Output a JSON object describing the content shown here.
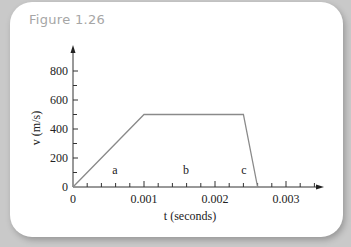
{
  "figure": {
    "title": "Figure 1.26",
    "background_color": "#c9c9c9",
    "card_color": "#ffffff",
    "title_color": "#a6a6a6",
    "line_color": "#8a8a8a"
  },
  "chart_data": {
    "type": "line",
    "title": "Figure 1.26",
    "xlabel": "t (seconds)",
    "ylabel": "v (m/s)",
    "x": [
      0,
      0.001,
      0.0024,
      0.0026
    ],
    "series": [
      {
        "name": "velocity",
        "values": [
          0,
          500,
          500,
          0
        ]
      }
    ],
    "xlim": [
      0,
      0.0036
    ],
    "ylim": [
      0,
      900
    ],
    "x_ticks": [
      "0",
      "0.001",
      "0.002",
      "0.003"
    ],
    "y_ticks": [
      "0",
      "200",
      "400",
      "600",
      "800"
    ],
    "x_minor_step": 0.0002,
    "y_minor_step": 100,
    "grid": false,
    "legend": null,
    "annotations": [
      {
        "text": "a",
        "x": 0.0006,
        "y": 60,
        "meaning": "acceleration phase"
      },
      {
        "text": "b",
        "x": 0.0016,
        "y": 60,
        "meaning": "constant velocity phase"
      },
      {
        "text": "c",
        "x": 0.0024,
        "y": 60,
        "meaning": "deceleration phase"
      }
    ]
  },
  "labels": {
    "x_axis": "t (seconds)",
    "y_axis": "v (m/s)",
    "x_ticks": [
      "0",
      "0.001",
      "0.002",
      "0.003"
    ],
    "y_ticks": [
      "0",
      "200",
      "400",
      "600",
      "800"
    ],
    "region_a": "a",
    "region_b": "b",
    "region_c": "c"
  }
}
